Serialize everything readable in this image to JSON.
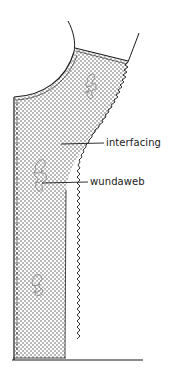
{
  "diagram": {
    "labels": [
      {
        "id": "interfacing",
        "text": "interfacing"
      },
      {
        "id": "wundaweb",
        "text": "wundaweb"
      }
    ],
    "colors": {
      "ink": "#1a1a1a",
      "dot": "#333333",
      "background": "#ffffff"
    }
  }
}
